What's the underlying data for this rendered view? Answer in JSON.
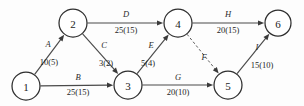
{
  "diagram": {
    "type": "directed-network",
    "width": 304,
    "height": 106,
    "colors": {
      "background": "#fdfdfd",
      "node_stroke": "#2e2e2e",
      "node_fill": "#ffffff",
      "edge_stroke": "#4a4a4a",
      "dummy_edge_stroke": "#5a5a5a",
      "text": "#1d1d1d"
    },
    "nodes": [
      {
        "id": "1",
        "label": "1",
        "x": 26,
        "y": 86,
        "r": 14
      },
      {
        "id": "2",
        "label": "2",
        "x": 73,
        "y": 23,
        "r": 14
      },
      {
        "id": "3",
        "label": "3",
        "x": 128,
        "y": 85,
        "r": 14
      },
      {
        "id": "4",
        "label": "4",
        "x": 178,
        "y": 23,
        "r": 14
      },
      {
        "id": "5",
        "label": "5",
        "x": 228,
        "y": 85,
        "r": 14
      },
      {
        "id": "6",
        "label": "6",
        "x": 278,
        "y": 23,
        "r": 13
      }
    ],
    "edges": [
      {
        "id": "A",
        "letter": "A",
        "value": "10(5)",
        "from": "1",
        "to": "2",
        "style": "solid",
        "letter_x": 48,
        "letter_y": 44,
        "value_x": 49,
        "value_y": 62
      },
      {
        "id": "B",
        "letter": "B",
        "value": "25(15)",
        "from": "1",
        "to": "3",
        "style": "solid",
        "letter_x": 78,
        "letter_y": 77,
        "value_x": 78,
        "value_y": 92
      },
      {
        "id": "C",
        "letter": "C",
        "value": "3(2)",
        "from": "2",
        "to": "3",
        "style": "solid",
        "letter_x": 104,
        "letter_y": 45,
        "value_x": 106,
        "value_y": 63
      },
      {
        "id": "D",
        "letter": "D",
        "value": "25(15)",
        "from": "2",
        "to": "4",
        "style": "solid",
        "letter_x": 126,
        "letter_y": 14,
        "value_x": 126,
        "value_y": 30
      },
      {
        "id": "E",
        "letter": "E",
        "value": "5(4)",
        "from": "3",
        "to": "4",
        "style": "solid",
        "letter_x": 151,
        "letter_y": 45,
        "value_x": 148,
        "value_y": 63
      },
      {
        "id": "F",
        "letter": "F",
        "value": "",
        "from": "4",
        "to": "5",
        "style": "dashed",
        "letter_x": 204,
        "letter_y": 57,
        "value_x": 204,
        "value_y": 70
      },
      {
        "id": "G",
        "letter": "G",
        "value": "20(10)",
        "from": "3",
        "to": "5",
        "style": "solid",
        "letter_x": 178,
        "letter_y": 77,
        "value_x": 178,
        "value_y": 92
      },
      {
        "id": "H",
        "letter": "H",
        "value": "20(15)",
        "from": "4",
        "to": "6",
        "style": "solid",
        "letter_x": 228,
        "letter_y": 14,
        "value_x": 228,
        "value_y": 30
      },
      {
        "id": "I",
        "letter": "I",
        "value": "15(10)",
        "from": "5",
        "to": "6",
        "style": "solid",
        "letter_x": 257,
        "letter_y": 47,
        "value_x": 262,
        "value_y": 65
      }
    ]
  }
}
